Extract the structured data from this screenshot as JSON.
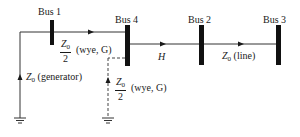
{
  "diagram": {
    "type": "zero-sequence network / one-line diagram",
    "buses": [
      {
        "id": "bus1",
        "label": "Bus 1"
      },
      {
        "id": "bus4",
        "label": "Bus 4"
      },
      {
        "id": "bus2",
        "label": "Bus 2"
      },
      {
        "id": "bus3",
        "label": "Bus 3"
      }
    ],
    "labels": {
      "transformer1_num": "Z",
      "transformer1_sub": "0",
      "transformer1_den": "2",
      "transformer1_note": "(wye, G)",
      "h_label": "H",
      "line_z": "Z",
      "line_sub": "0",
      "line_note": "(line)",
      "gen_z": "Z",
      "gen_sub": "0",
      "gen_note": "(generator)",
      "transformer2_num": "Z",
      "transformer2_sub": "0",
      "transformer2_den": "2",
      "transformer2_note": "(wye, G)"
    },
    "edges": [
      {
        "from": "ground",
        "to": "bus1",
        "label": "Z0 (generator)"
      },
      {
        "from": "bus1",
        "to": "bus4",
        "label": "Z0/2 (wye, G)"
      },
      {
        "from": "bus4",
        "to": "bus2",
        "label": "H"
      },
      {
        "from": "bus2",
        "to": "bus3",
        "label": "Z0 (line)"
      },
      {
        "from": "ground",
        "to": "bus4",
        "label": "Z0/2 (wye, G)",
        "style": "dashed"
      }
    ],
    "colors": {
      "line": "#1a1a1a",
      "background": "#ffffff"
    }
  }
}
